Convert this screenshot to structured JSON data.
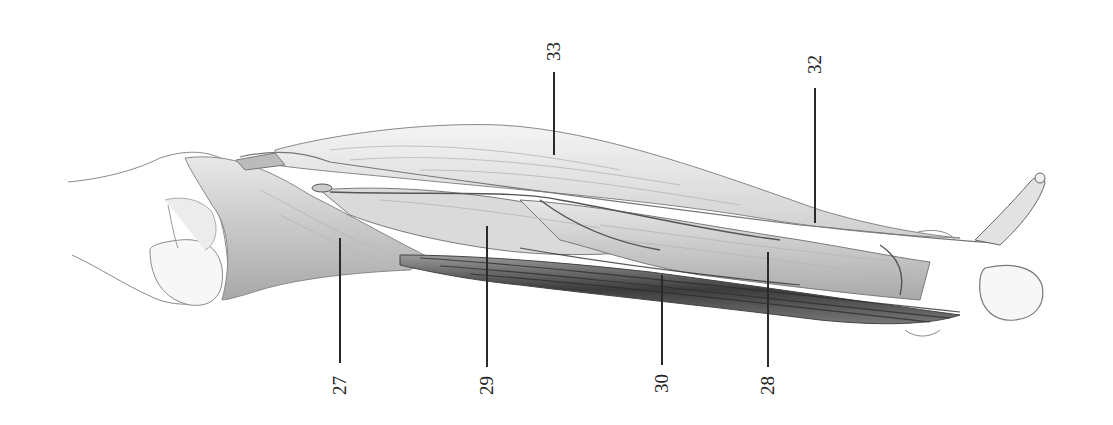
{
  "figure": {
    "colors": {
      "paper": "#ffffff",
      "ink": "#2a2a2a",
      "shade_dark": "#3a3a3a",
      "shade_mid": "#8a8a8a",
      "shade_light": "#cfcfcf"
    }
  },
  "labels": [
    {
      "id": "27",
      "text": "27",
      "x": 340,
      "text_y": 385,
      "line_top": 238,
      "line_bottom": 363
    },
    {
      "id": "29",
      "text": "29",
      "x": 487,
      "text_y": 385,
      "line_top": 226,
      "line_bottom": 367
    },
    {
      "id": "30",
      "text": "30",
      "x": 662,
      "text_y": 385,
      "line_top": 275,
      "line_bottom": 365
    },
    {
      "id": "28",
      "text": "28",
      "x": 768,
      "text_y": 385,
      "line_top": 252,
      "line_bottom": 367
    },
    {
      "id": "33",
      "text": "33",
      "x": 554,
      "text_y": 52,
      "line_top": 72,
      "line_bottom": 155
    },
    {
      "id": "32",
      "text": "32",
      "x": 815,
      "text_y": 65,
      "line_top": 88,
      "line_bottom": 223
    }
  ]
}
